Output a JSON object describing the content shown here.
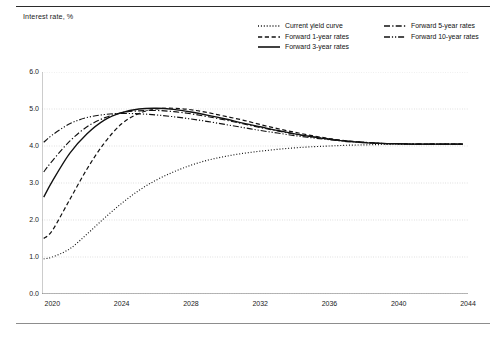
{
  "figure": {
    "axis_title": "Interest rate, %",
    "background_color": "#ffffff",
    "line_color": "#111111",
    "grid_color": "#c8c8c8"
  },
  "legend": {
    "entries": [
      {
        "label": "Current yield curve",
        "style": "dotted",
        "column": "a"
      },
      {
        "label": "Forward 1-year rates",
        "style": "dashed",
        "column": "a"
      },
      {
        "label": "Forward 3-year rates",
        "style": "solid",
        "column": "a"
      },
      {
        "label": "Forward 5-year rates",
        "style": "dash-dot",
        "column": "b"
      },
      {
        "label": "Forward 10-year rates",
        "style": "dash-dot-dot",
        "column": "b"
      }
    ]
  },
  "chart_data": {
    "type": "line",
    "title": "",
    "subtitle": "",
    "xlabel": "",
    "ylabel": "Interest rate, %",
    "xlim": [
      2019.4,
      2044
    ],
    "ylim": [
      0.0,
      6.0
    ],
    "yticks": [
      0.0,
      1.0,
      2.0,
      3.0,
      4.0,
      5.0,
      6.0
    ],
    "ytick_labels": [
      "0.0",
      "1.0",
      "2.0",
      "3.0",
      "4.0",
      "5.0",
      "6.0"
    ],
    "xticks": [
      2020,
      2024,
      2028,
      2032,
      2036,
      2040,
      2044
    ],
    "xtick_labels": [
      "2020",
      "2024",
      "2028",
      "2032",
      "2036",
      "2040",
      "2044"
    ],
    "minor_xtick_step": 1,
    "grid": "horizontal-dotted",
    "legend_position": "top-right",
    "series": [
      {
        "name": "Current yield curve",
        "style": "dotted",
        "x": [
          2019.5,
          2020,
          2021,
          2022,
          2023,
          2024,
          2025,
          2026,
          2027,
          2028,
          2029,
          2030,
          2031,
          2032,
          2033,
          2034,
          2035,
          2036,
          2037,
          2038,
          2039,
          2040,
          2041,
          2042,
          2043,
          2043.7
        ],
        "y": [
          0.95,
          1.0,
          1.22,
          1.62,
          2.05,
          2.45,
          2.8,
          3.08,
          3.3,
          3.48,
          3.62,
          3.72,
          3.8,
          3.86,
          3.91,
          3.95,
          3.98,
          4.0,
          4.02,
          4.03,
          4.04,
          4.05,
          4.05,
          4.05,
          4.05,
          4.05
        ]
      },
      {
        "name": "Forward 1-year rates",
        "style": "dashed",
        "x": [
          2019.5,
          2020,
          2021,
          2022,
          2023,
          2024,
          2025,
          2026,
          2027,
          2028,
          2029,
          2030,
          2031,
          2032,
          2033,
          2034,
          2035,
          2036,
          2037,
          2038,
          2039,
          2040,
          2041,
          2042,
          2043,
          2043.7
        ],
        "y": [
          1.5,
          1.72,
          2.55,
          3.38,
          4.08,
          4.6,
          4.88,
          5.0,
          5.02,
          4.98,
          4.9,
          4.8,
          4.7,
          4.58,
          4.47,
          4.37,
          4.28,
          4.2,
          4.14,
          4.1,
          4.07,
          4.06,
          4.05,
          4.05,
          4.05,
          4.05
        ]
      },
      {
        "name": "Forward 3-year rates",
        "style": "solid",
        "x": [
          2019.5,
          2020,
          2021,
          2022,
          2023,
          2024,
          2025,
          2026,
          2027,
          2028,
          2029,
          2030,
          2031,
          2032,
          2033,
          2034,
          2035,
          2036,
          2037,
          2038,
          2039,
          2040,
          2041,
          2042,
          2043,
          2043.7
        ],
        "y": [
          2.62,
          3.05,
          3.8,
          4.33,
          4.7,
          4.9,
          5.0,
          5.02,
          4.99,
          4.92,
          4.83,
          4.73,
          4.62,
          4.52,
          4.42,
          4.33,
          4.25,
          4.18,
          4.13,
          4.09,
          4.07,
          4.06,
          4.05,
          4.05,
          4.05,
          4.05
        ]
      },
      {
        "name": "Forward 5-year rates",
        "style": "dash-dot",
        "x": [
          2019.5,
          2020,
          2021,
          2022,
          2023,
          2024,
          2025,
          2026,
          2027,
          2028,
          2029,
          2030,
          2031,
          2032,
          2033,
          2034,
          2035,
          2036,
          2037,
          2038,
          2039,
          2040,
          2041,
          2042,
          2043,
          2043.7
        ],
        "y": [
          3.3,
          3.6,
          4.13,
          4.52,
          4.76,
          4.9,
          4.95,
          4.96,
          4.93,
          4.87,
          4.79,
          4.7,
          4.6,
          4.5,
          4.41,
          4.32,
          4.25,
          4.19,
          4.13,
          4.1,
          4.07,
          4.06,
          4.05,
          4.05,
          4.05,
          4.05
        ]
      },
      {
        "name": "Forward 10-year rates",
        "style": "dash-dot-dot",
        "x": [
          2019.5,
          2020,
          2021,
          2022,
          2023,
          2024,
          2025,
          2026,
          2027,
          2028,
          2029,
          2030,
          2031,
          2032,
          2033,
          2034,
          2035,
          2036,
          2037,
          2038,
          2039,
          2040,
          2041,
          2042,
          2043,
          2043.7
        ],
        "y": [
          4.1,
          4.3,
          4.6,
          4.77,
          4.85,
          4.88,
          4.87,
          4.84,
          4.79,
          4.73,
          4.66,
          4.58,
          4.5,
          4.42,
          4.35,
          4.28,
          4.22,
          4.17,
          4.12,
          4.09,
          4.07,
          4.06,
          4.05,
          4.05,
          4.05,
          4.05
        ]
      }
    ]
  }
}
